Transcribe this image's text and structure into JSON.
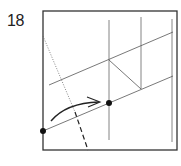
{
  "diagram": {
    "step_number": "18",
    "type": "origami-fold-step",
    "colors": {
      "outline": "#333333",
      "crease": "#555555",
      "dot": "#111111",
      "arrow": "#222222"
    },
    "elements": {
      "paper_square": {
        "x": 43,
        "y": 11,
        "w": 134,
        "h": 139
      },
      "points": [
        {
          "name": "corner-point",
          "x": 43,
          "y": 131
        },
        {
          "name": "target-point",
          "x": 109,
          "y": 103
        }
      ],
      "fold_arrow": {
        "from": [
          50,
          120
        ],
        "to": [
          100,
          101
        ]
      },
      "valley_fold_line": {
        "from": [
          43,
          36
        ],
        "to": [
          88,
          150
        ]
      }
    }
  }
}
